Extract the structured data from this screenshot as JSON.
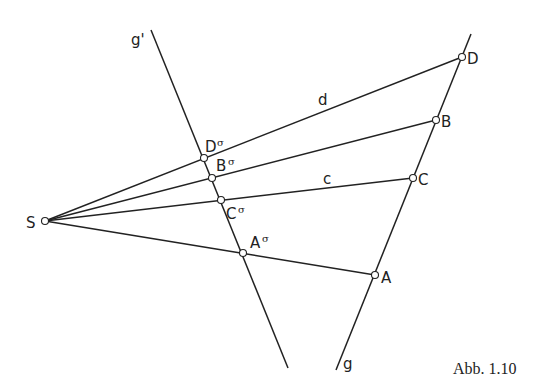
{
  "figure": {
    "caption": "Abb. 1.10",
    "lines": {
      "g": {
        "label": "g",
        "x1": 471,
        "y1": 34,
        "x2": 336,
        "y2": 370,
        "lx": 343,
        "ly": 369
      },
      "g_prime": {
        "label": "g'",
        "x1": 151,
        "y1": 30,
        "x2": 288,
        "y2": 368,
        "lx": 131,
        "ly": 45
      }
    },
    "center": {
      "label": "S",
      "x": 45,
      "y": 221,
      "lx": 26,
      "ly": 228
    },
    "points": [
      {
        "label": "D",
        "x": 462,
        "y": 57,
        "lx": 467,
        "ly": 64,
        "image": {
          "label": "D",
          "sup": "σ",
          "x": 204,
          "y": 158,
          "lx": 205,
          "ly": 152
        }
      },
      {
        "label": "B",
        "x": 436,
        "y": 120,
        "lx": 441,
        "ly": 127,
        "image": {
          "label": "B",
          "sup": "σ",
          "x": 212,
          "y": 178,
          "lx": 216,
          "ly": 171
        }
      },
      {
        "label": "C",
        "x": 413,
        "y": 178,
        "lx": 418,
        "ly": 185,
        "image": {
          "label": "C",
          "sup": "σ",
          "x": 221,
          "y": 200,
          "lx": 226,
          "ly": 219
        }
      },
      {
        "label": "A",
        "x": 375,
        "y": 275,
        "lx": 381,
        "ly": 283,
        "image": {
          "label": "A",
          "sup": "σ",
          "x": 243,
          "y": 253,
          "lx": 250,
          "ly": 248
        }
      }
    ],
    "ray_labels": [
      {
        "label": "d",
        "x": 318,
        "y": 105
      },
      {
        "label": "c",
        "x": 323,
        "y": 184
      }
    ],
    "colors": {
      "stroke": "#222222",
      "background": "#ffffff"
    }
  }
}
